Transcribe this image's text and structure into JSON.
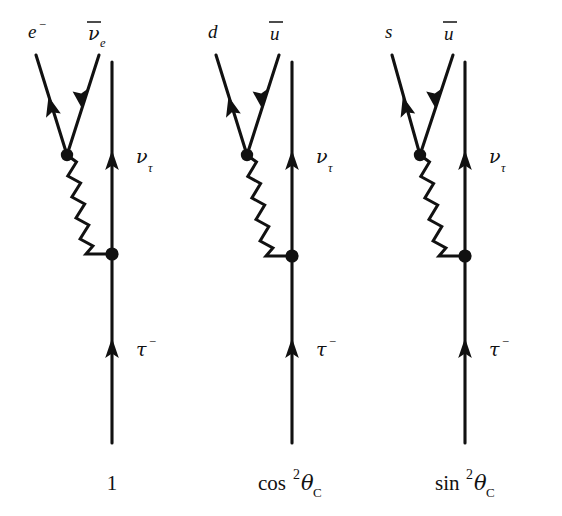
{
  "figure": {
    "background_color": "#ffffff",
    "ink_color": "#111111",
    "width": 562,
    "height": 516
  },
  "diagrams": [
    {
      "id": "leptonic-decay",
      "index": 0,
      "amplitude_label": {
        "text": "1",
        "base": "1",
        "superscript": "",
        "subscript": "",
        "x": 117,
        "y": 487
      },
      "incoming": {
        "name": "tau",
        "label_base": "τ",
        "label_sup": "−",
        "label_x": 136,
        "label_y": 356
      },
      "outgoing_fermion": {
        "name": "tau-neutrino",
        "label_base": "ν",
        "label_sub": "τ",
        "label_x": 136,
        "label_y": 163
      },
      "branch_left": {
        "name": "electron",
        "label_base": "e",
        "label_sup": "−",
        "overbar": false,
        "label_x": 28,
        "label_y": 38
      },
      "branch_right": {
        "name": "electron-antineutrino",
        "label_base": "ν",
        "label_sub": "e",
        "overbar": true,
        "label_x": 88,
        "label_y": 40
      },
      "boson": {
        "name": "w-boson",
        "style": "zigzag"
      }
    },
    {
      "id": "hadronic-decay-cabibbo-favored",
      "index": 1,
      "amplitude_label": {
        "text": "cos²θC",
        "base": "cos",
        "superscript": "2",
        "greek": "θ",
        "subscript": "C",
        "x": 290,
        "y": 487
      },
      "incoming": {
        "name": "tau",
        "label_base": "τ",
        "label_sup": "−",
        "label_x": 316,
        "label_y": 356
      },
      "outgoing_fermion": {
        "name": "tau-neutrino",
        "label_base": "ν",
        "label_sub": "τ",
        "label_x": 316,
        "label_y": 163
      },
      "branch_left": {
        "name": "down-quark",
        "label_base": "d",
        "label_sup": "",
        "overbar": false,
        "label_x": 212,
        "label_y": 38
      },
      "branch_right": {
        "name": "up-antiquark",
        "label_base": "u",
        "label_sub": "",
        "overbar": true,
        "label_x": 272,
        "label_y": 40
      },
      "boson": {
        "name": "w-boson",
        "style": "zigzag"
      }
    },
    {
      "id": "hadronic-decay-cabibbo-suppressed",
      "index": 2,
      "amplitude_label": {
        "text": "sin²θC",
        "base": "sin",
        "superscript": "2",
        "greek": "θ",
        "subscript": "C",
        "x": 464,
        "y": 487
      },
      "incoming": {
        "name": "tau",
        "label_base": "τ",
        "label_sup": "−",
        "label_x": 489,
        "label_y": 356
      },
      "outgoing_fermion": {
        "name": "tau-neutrino",
        "label_base": "ν",
        "label_sub": "τ",
        "label_x": 489,
        "label_y": 163
      },
      "branch_left": {
        "name": "strange-quark",
        "label_base": "s",
        "label_sup": "",
        "overbar": false,
        "label_x": 390,
        "label_y": 38
      },
      "branch_right": {
        "name": "up-antiquark",
        "label_base": "u",
        "label_sub": "",
        "overbar": true,
        "label_x": 448,
        "label_y": 40
      },
      "boson": {
        "name": "w-boson",
        "style": "zigzag"
      }
    }
  ],
  "geometry": {
    "fermion_axis_x": [
      112,
      292,
      465
    ],
    "fermion_axis_top_y": 62,
    "fermion_axis_bottom_y": 443,
    "upper_vertex": [
      [
        67,
        155
      ],
      [
        247,
        155
      ],
      [
        420,
        155
      ]
    ],
    "lower_vertex": [
      [
        112,
        254
      ],
      [
        292,
        256
      ],
      [
        465,
        256
      ]
    ],
    "branch_left_start": [
      [
        36,
        55
      ],
      [
        216,
        55
      ],
      [
        392,
        55
      ]
    ],
    "branch_right_start": [
      [
        99,
        55
      ],
      [
        279,
        55
      ],
      [
        453,
        55
      ]
    ],
    "neutrino_arrow_y": 167,
    "tau_arrow_y": 355
  }
}
